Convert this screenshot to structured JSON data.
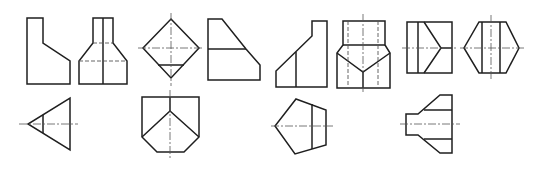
{
  "figure": {
    "background": "#ffffff",
    "line_color": "#1f1f1f",
    "row1_count": 8,
    "row2_count": 4,
    "views_row1": [
      {
        "id": "fig1",
        "kind": "stepped-profile"
      },
      {
        "id": "fig2",
        "kind": "tapered-front-view"
      },
      {
        "id": "fig3",
        "kind": "diamond-top-view"
      },
      {
        "id": "fig4",
        "kind": "chamfered-side-view"
      },
      {
        "id": "fig5",
        "kind": "stepped-ramp-profile"
      },
      {
        "id": "fig6",
        "kind": "v-notch-front-view"
      },
      {
        "id": "fig7",
        "kind": "chevron-rect-view"
      },
      {
        "id": "fig8",
        "kind": "hexagon-view"
      }
    ],
    "views_row2": [
      {
        "id": "fig9",
        "kind": "triangle-view"
      },
      {
        "id": "fig10",
        "kind": "pointed-shield-view"
      },
      {
        "id": "fig11",
        "kind": "pentagon-view"
      },
      {
        "id": "fig12",
        "kind": "flanged-nozzle-view"
      }
    ]
  }
}
